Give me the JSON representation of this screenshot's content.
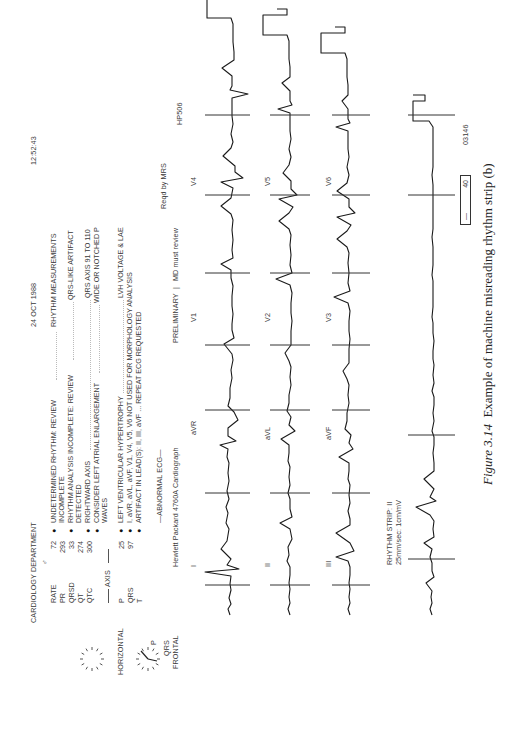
{
  "header": {
    "department": "CARDIOLOGY DEPARTMENT",
    "sex_symbol": "♂",
    "date": "24 OCT 1988",
    "time": "12:52:43"
  },
  "measurements": [
    {
      "label": "RATE",
      "value": "72"
    },
    {
      "label": "PR",
      "value": "293"
    },
    {
      "label": "QRSD",
      "value": "33"
    },
    {
      "label": "QT",
      "value": "274"
    },
    {
      "label": "QTC",
      "value": "300"
    }
  ],
  "axis": {
    "title": "AXIS",
    "rows": [
      {
        "label": "P",
        "value": "25"
      },
      {
        "label": "QRS",
        "value": "97"
      },
      {
        "label": "T",
        "value": ""
      }
    ],
    "horizontal_label": "HORIZONTAL",
    "frontal_label": "FRONTAL",
    "p_label": "P",
    "qrs_label": "QRS"
  },
  "statements": [
    {
      "text": "UNDETERMINED RHYTHM: REVIEW",
      "cont": "INCOMPLETE",
      "bullet": true,
      "reason": "RHYTHM MEASUREMENTS",
      "reason2": ""
    },
    {
      "text": "RHYTHM ANALYSIS INCOMPLETE: REVIEW",
      "cont": "DETECTED",
      "bullet": true,
      "reason": "QRS-LIKE ARTIFACT",
      "reason2": ""
    },
    {
      "text": "RIGHTWARD AXIS",
      "cont": "",
      "bullet": true,
      "reason": "QRS AXIS 91 TO 110",
      "reason2": ""
    },
    {
      "text": "CONSIDER LEFT ATRIAL ENLARGEMENT",
      "cont": "WAVES",
      "bullet": true,
      "reason": "WIDE OR NOTCHED P",
      "reason2": ""
    },
    {
      "text": "LEFT VENTRICULAR HYPERTROPHY",
      "cont": "",
      "bullet": true,
      "reason": "LVH VOLTAGE & LAE",
      "reason2": ""
    },
    {
      "text": "I, aVR, aVL, aVF, V1, V4, V5, V6 NOT USED FOR MORPHOLOGY ANALYSIS",
      "cont": "",
      "bullet": true,
      "reason": "",
      "reason2": ""
    },
    {
      "text": "ARTIFACT IN LEAD(S): II, III, aVF ... REPEAT ECG REQUESTED",
      "cont": "",
      "bullet": true,
      "reason": "",
      "reason2": ""
    }
  ],
  "summary": "—ABNORMAL ECG—",
  "device": "Hewlett Packard 4760A Cardiograph",
  "status": {
    "preliminary": "PRELIMINARY",
    "separator": "|",
    "review": "MD must review",
    "requested_by": "Reqd by MRS",
    "model_code": "HP506"
  },
  "leads": {
    "row1": [
      "I",
      "aVR",
      "V1",
      "V4"
    ],
    "row2": [
      "II",
      "aVL",
      "V2",
      "V5"
    ],
    "row3": [
      "III",
      "aVF",
      "V3",
      "V6"
    ]
  },
  "rhythm_strip": {
    "label": "RHYTHM STRIP: II",
    "settings": "25mm/sec: 1cm/mV"
  },
  "footer": {
    "boxed_dash": "—",
    "boxed_value": "40",
    "serial": "03146"
  },
  "caption": {
    "figure_label": "Figure 3.14",
    "text": "Example of machine misreading rhythm strip (b)"
  }
}
